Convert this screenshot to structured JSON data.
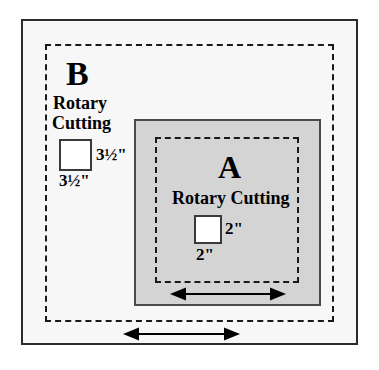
{
  "diagram": {
    "colors": {
      "page_background": "#ffffff",
      "frame_background": "#f7f7f7",
      "block_a_fill": "#d4d4d4",
      "outline": "#2b2b2b",
      "dashed_line": "#1a1a1a",
      "square_fill": "#ffffff"
    },
    "block_b": {
      "letter": "B",
      "method_line1": "Rotary",
      "method_line2": "Cutting",
      "size_width": "3½\"",
      "size_height": "3½\"",
      "square_icon": "white-square-icon",
      "cut_line_style": "dashed",
      "arrow_icon": "double-headed-arrow-icon"
    },
    "block_a": {
      "letter": "A",
      "method": "Rotary Cutting",
      "size_width": "2\"",
      "size_height": "2\"",
      "square_icon": "white-square-icon",
      "cut_line_style": "dashed",
      "fill": "gray",
      "arrow_icon": "double-headed-arrow-icon"
    }
  }
}
